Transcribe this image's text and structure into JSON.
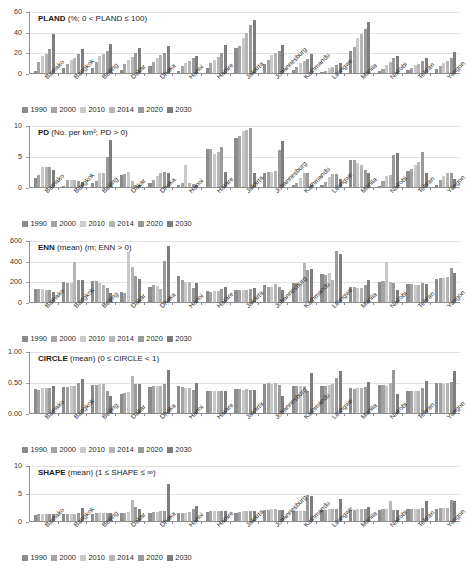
{
  "figure": {
    "cities": [
      "Bamako",
      "Bangkok",
      "Beijing",
      "Dakar",
      "Dhaka",
      "Hanoi",
      "Harare",
      "Jakarta",
      "Johannesburg",
      "Kathmandu",
      "Lilongwe",
      "Manila",
      "Nairobi",
      "Tehran",
      "Yangon"
    ],
    "years": [
      "1990",
      "2000",
      "2010",
      "2014",
      "2020",
      "2030"
    ],
    "series_colors": [
      "#8c8c8c",
      "#a3a3a3",
      "#c9c9c9",
      "#b5b5b5",
      "#9a9a9a",
      "#7d7d7d"
    ],
    "legend_title": ""
  },
  "chart_data": [
    {
      "type": "bar",
      "id": "pland",
      "title": "PLAND (%; 0 < PLAND ≤ 100)",
      "title_bold": "PLAND",
      "title_rest": " (%; 0 < PLAND ≤ 100)",
      "xlabel": "",
      "ylabel": "",
      "ylim": [
        0,
        60
      ],
      "yticks": [
        0,
        20,
        40,
        60
      ],
      "ytick_labels": [
        "0",
        "20",
        "40",
        "60"
      ],
      "grid": true,
      "legend_position": "bottom-left",
      "categories": [
        "Bamako",
        "Bangkok",
        "Beijing",
        "Dakar",
        "Dhaka",
        "Hanoi",
        "Harare",
        "Jakarta",
        "Johannesburg",
        "Kathmandu",
        "Lilongwe",
        "Manila",
        "Nairobi",
        "Tehran",
        "Yangon"
      ],
      "series": [
        {
          "name": "1990",
          "values": [
            1.5,
            4.5,
            5.0,
            3.0,
            7.0,
            2.0,
            5.0,
            24.0,
            9.0,
            2.5,
            1.0,
            21.0,
            2.0,
            3.0,
            4.0
          ]
        },
        {
          "name": "2000",
          "values": [
            10.5,
            9.0,
            11.0,
            8.5,
            11.0,
            6.5,
            9.5,
            26.5,
            13.0,
            6.0,
            2.0,
            25.0,
            4.0,
            5.0,
            7.0
          ]
        },
        {
          "name": "2010",
          "values": [
            16.0,
            13.0,
            16.0,
            13.0,
            15.0,
            9.5,
            13.0,
            33.5,
            17.0,
            9.5,
            4.5,
            33.5,
            8.0,
            7.5,
            10.0
          ]
        },
        {
          "name": "2014",
          "values": [
            18.5,
            15.0,
            18.0,
            15.5,
            17.0,
            11.5,
            15.5,
            39.0,
            19.0,
            11.5,
            6.0,
            37.5,
            10.5,
            9.0,
            12.0
          ]
        },
        {
          "name": "2020",
          "values": [
            23.0,
            18.0,
            21.0,
            19.0,
            19.5,
            15.0,
            19.0,
            46.0,
            21.0,
            14.0,
            7.5,
            43.0,
            14.5,
            11.5,
            14.5
          ]
        },
        {
          "name": "2030",
          "values": [
            37.5,
            23.0,
            28.5,
            24.0,
            26.0,
            16.0,
            27.5,
            51.5,
            27.5,
            18.0,
            9.5,
            49.0,
            16.5,
            14.5,
            20.5
          ]
        }
      ]
    },
    {
      "type": "bar",
      "id": "pd",
      "title": "PD (No. per km²; PD > 0)",
      "title_bold": "PD",
      "title_rest": " (No. per km²; PD > 0)",
      "xlabel": "",
      "ylabel": "",
      "ylim": [
        0,
        10
      ],
      "yticks": [
        0,
        5,
        10
      ],
      "ytick_labels": [
        "0",
        "5",
        "10"
      ],
      "grid": true,
      "legend_position": "bottom-left",
      "categories": [
        "Bamako",
        "Bangkok",
        "Beijing",
        "Dakar",
        "Dhaka",
        "Hanoi",
        "Harare",
        "Jakarta",
        "Johannesburg",
        "Kathmandu",
        "Lilongwe",
        "Manila",
        "Nairobi",
        "Tehran",
        "Yangon"
      ],
      "series": [
        {
          "name": "1990",
          "values": [
            1.5,
            0.2,
            0.6,
            2.0,
            0.7,
            0.3,
            6.1,
            7.9,
            2.3,
            0.3,
            0.3,
            4.3,
            0.2,
            2.6,
            0.3
          ]
        },
        {
          "name": "2000",
          "values": [
            1.9,
            1.1,
            0.9,
            2.1,
            1.2,
            0.7,
            6.2,
            8.3,
            2.4,
            0.6,
            0.8,
            4.3,
            1.0,
            2.9,
            1.2
          ]
        },
        {
          "name": "2010",
          "values": [
            3.3,
            1.2,
            2.2,
            2.5,
            1.7,
            3.6,
            5.3,
            9.0,
            2.4,
            1.4,
            1.6,
            3.8,
            1.8,
            3.6,
            1.7
          ]
        },
        {
          "name": "2014",
          "values": [
            3.2,
            1.2,
            2.3,
            0.9,
            2.2,
            0.6,
            5.6,
            9.2,
            2.6,
            2.3,
            2.1,
            3.5,
            1.9,
            4.1,
            2.2
          ]
        },
        {
          "name": "2020",
          "values": [
            3.2,
            1.0,
            4.9,
            0.3,
            2.4,
            0.5,
            6.4,
            9.5,
            6.0,
            2.2,
            2.1,
            2.8,
            5.1,
            5.6,
            2.2
          ]
        },
        {
          "name": "2030",
          "values": [
            2.8,
            0.8,
            7.6,
            0.3,
            2.2,
            0.4,
            2.4,
            2.3,
            7.4,
            0.4,
            1.3,
            2.2,
            5.5,
            2.2,
            1.3
          ]
        }
      ]
    },
    {
      "type": "bar",
      "id": "enn",
      "title": "ENN (mean) (m; ENN > 0)",
      "title_bold": "ENN",
      "title_rest": " (mean) (m; ENN > 0)",
      "xlabel": "",
      "ylabel": "",
      "ylim": [
        0,
        600
      ],
      "yticks": [
        0,
        200,
        400,
        600
      ],
      "ytick_labels": [
        "0",
        "200",
        "400",
        "600"
      ],
      "grid": true,
      "legend_position": "bottom-left",
      "categories": [
        "Bamako",
        "Bangkok",
        "Beijing",
        "Dakar",
        "Dhaka",
        "Hanoi",
        "Harare",
        "Jakarta",
        "Johannesburg",
        "Kathmandu",
        "Lilongwe",
        "Manila",
        "Nairobi",
        "Tehran",
        "Yangon"
      ],
      "series": [
        {
          "name": "1990",
          "values": [
            125,
            195,
            200,
            95,
            150,
            255,
            105,
            120,
            160,
            185,
            270,
            150,
            190,
            175,
            225
          ]
        },
        {
          "name": "2000",
          "values": [
            125,
            185,
            205,
            90,
            160,
            215,
            100,
            120,
            150,
            180,
            265,
            145,
            200,
            170,
            235
          ]
        },
        {
          "name": "2010",
          "values": [
            125,
            185,
            185,
            480,
            155,
            190,
            105,
            120,
            150,
            165,
            280,
            140,
            390,
            165,
            235
          ]
        },
        {
          "name": "2014",
          "values": [
            115,
            385,
            165,
            340,
            130,
            190,
            110,
            120,
            175,
            380,
            215,
            140,
            195,
            160,
            240
          ]
        },
        {
          "name": "2020",
          "values": [
            120,
            210,
            135,
            250,
            400,
            135,
            130,
            130,
            150,
            310,
            490,
            160,
            185,
            185,
            330
          ]
        },
        {
          "name": "2030",
          "values": [
            100,
            215,
            90,
            225,
            545,
            180,
            150,
            140,
            115,
            320,
            465,
            215,
            120,
            175,
            285
          ]
        }
      ]
    },
    {
      "type": "bar",
      "id": "circle",
      "title": "CIRCLE (mean) (0 ≤ CIRCLE < 1)",
      "title_bold": "CIRCLE",
      "title_rest": " (mean) (0 ≤ CIRCLE < 1)",
      "xlabel": "",
      "ylabel": "",
      "ylim": [
        0,
        1
      ],
      "yticks": [
        0,
        0.5,
        1
      ],
      "ytick_labels": [
        "0.00",
        "0.50",
        "1.00"
      ],
      "grid": true,
      "legend_position": "bottom-left",
      "categories": [
        "Bamako",
        "Bangkok",
        "Beijing",
        "Dakar",
        "Dhaka",
        "Hanoi",
        "Harare",
        "Jakarta",
        "Johannesburg",
        "Kathmandu",
        "Lilongwe",
        "Manila",
        "Nairobi",
        "Tehran",
        "Yangon"
      ],
      "series": [
        {
          "name": "1990",
          "values": [
            0.38,
            0.42,
            0.45,
            0.31,
            0.42,
            0.43,
            0.36,
            0.39,
            0.47,
            0.43,
            0.44,
            0.4,
            0.45,
            0.36,
            0.48
          ]
        },
        {
          "name": "2000",
          "values": [
            0.37,
            0.42,
            0.45,
            0.32,
            0.43,
            0.42,
            0.36,
            0.38,
            0.48,
            0.43,
            0.44,
            0.39,
            0.45,
            0.36,
            0.48
          ]
        },
        {
          "name": "2010",
          "values": [
            0.4,
            0.43,
            0.46,
            0.34,
            0.44,
            0.41,
            0.35,
            0.37,
            0.47,
            0.43,
            0.45,
            0.4,
            0.44,
            0.36,
            0.47
          ]
        },
        {
          "name": "2014",
          "values": [
            0.4,
            0.44,
            0.47,
            0.6,
            0.44,
            0.4,
            0.35,
            0.38,
            0.48,
            0.43,
            0.46,
            0.41,
            0.48,
            0.35,
            0.48
          ]
        },
        {
          "name": "2020",
          "values": [
            0.41,
            0.49,
            0.36,
            0.47,
            0.47,
            0.37,
            0.36,
            0.37,
            0.45,
            0.35,
            0.57,
            0.42,
            0.7,
            0.4,
            0.5
          ]
        },
        {
          "name": "2030",
          "values": [
            0.44,
            0.55,
            0.27,
            0.46,
            0.7,
            0.48,
            0.36,
            0.37,
            0.28,
            0.65,
            0.67,
            0.5,
            0.31,
            0.52,
            0.68
          ]
        }
      ]
    },
    {
      "type": "bar",
      "id": "shape",
      "title": "SHAPE (mean) (1 ≤ SHAPE ≤ ∞)",
      "title_bold": "SHAPE",
      "title_rest": " (mean) (1 ≤ SHAPE ≤ ∞)",
      "xlabel": "",
      "ylabel": "",
      "ylim": [
        0,
        10
      ],
      "yticks": [
        0,
        5,
        10
      ],
      "ytick_labels": [
        "0",
        "5",
        "10"
      ],
      "grid": true,
      "legend_position": "bottom-left",
      "categories": [
        "Bamako",
        "Bangkok",
        "Beijing",
        "Dakar",
        "Dhaka",
        "Hanoi",
        "Harare",
        "Jakarta",
        "Johannesburg",
        "Kathmandu",
        "Lilongwe",
        "Manila",
        "Nairobi",
        "Tehran",
        "Yangon"
      ],
      "series": [
        {
          "name": "1990",
          "values": [
            1.1,
            1.2,
            1.3,
            1.5,
            1.5,
            1.5,
            1.6,
            1.5,
            1.9,
            1.7,
            1.9,
            1.9,
            2.0,
            2.1,
            2.2
          ]
        },
        {
          "name": "2000",
          "values": [
            1.3,
            1.2,
            1.4,
            1.5,
            1.6,
            1.5,
            1.7,
            1.6,
            2.0,
            1.7,
            2.0,
            2.0,
            2.1,
            2.2,
            2.3
          ]
        },
        {
          "name": "2010",
          "values": [
            1.3,
            1.3,
            1.5,
            1.6,
            1.6,
            1.5,
            1.7,
            1.7,
            2.1,
            1.8,
            2.1,
            2.1,
            2.2,
            2.2,
            2.3
          ]
        },
        {
          "name": "2014",
          "values": [
            1.3,
            1.3,
            1.5,
            3.7,
            1.7,
            1.6,
            1.8,
            1.7,
            2.1,
            1.8,
            2.1,
            2.1,
            3.6,
            2.2,
            2.4
          ]
        },
        {
          "name": "2020",
          "values": [
            1.3,
            1.5,
            1.5,
            2.5,
            1.8,
            2.1,
            1.8,
            1.8,
            2.0,
            4.7,
            2.2,
            2.2,
            2.0,
            2.3,
            3.8
          ]
        },
        {
          "name": "2030",
          "values": [
            1.3,
            2.4,
            1.4,
            2.2,
            6.6,
            2.6,
            1.8,
            1.8,
            1.9,
            4.5,
            3.9,
            2.5,
            1.9,
            3.5,
            3.6
          ]
        }
      ]
    }
  ]
}
